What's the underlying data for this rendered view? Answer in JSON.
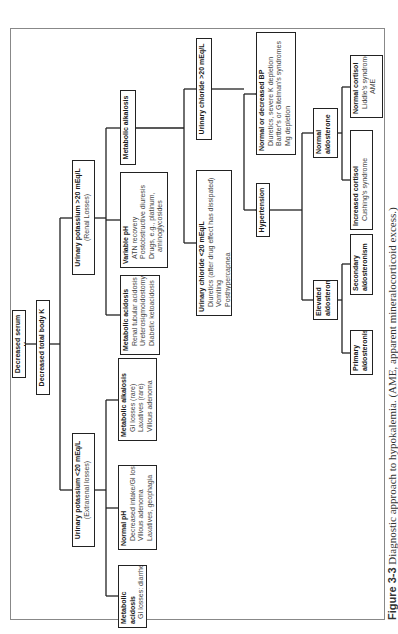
{
  "figure": {
    "caption_label": "Figure 3-3",
    "caption_text": "Diagnostic approach to hypokalemia. (AME, apparent mineralocorticoid excess.)",
    "orientation": "rotated 90 degrees counter-clockwise"
  },
  "nodes": {
    "root": {
      "title": "Decreased serum K"
    },
    "total_body": {
      "title": "Decreased total body K"
    },
    "extrarenal": {
      "title": "Urinary potassium <20 mEq/L",
      "subtitle": "(Extrarenal losses)"
    },
    "renal": {
      "title": "Urinary potassium >20 mEq/L",
      "subtitle": "(Renal Losses)"
    },
    "ext_acidosis": {
      "title": "Metabolic acidosis",
      "lines": [
        "GI losses: diarrhea,",
        "laxatives"
      ]
    },
    "ext_normal_ph": {
      "title": "Normal pH",
      "lines": [
        "Decreased intake/GI losses",
        "Villous adenoma",
        "Laxatives, geophagia"
      ]
    },
    "ext_alkalosis": {
      "title": "Metabolic alkalosis",
      "lines": [
        "GI losses (rare)",
        "Laxatives (rare)",
        "Villous adenoma"
      ]
    },
    "ren_acidosis": {
      "title": "Metabolic acidosis",
      "lines": [
        "Renal tubular acidosis",
        "Ureterosigmoidostomy",
        "Diabetic ketoacidosis"
      ]
    },
    "ren_variable_ph": {
      "title": "Variable pH",
      "lines": [
        "ATN recovery",
        "Postobstructive diuresis",
        "Drugs, e.g., platinum,",
        "aminoglycosides"
      ]
    },
    "ren_alkalosis": {
      "title": "Metabolic alkalosis"
    },
    "cl_low": {
      "title": "Urinary chloride <20 mEq/L",
      "lines": [
        "Diuretics (after drug effect has dissipated)",
        "Vomiting",
        "Posthypercapnea"
      ]
    },
    "cl_high": {
      "title": "Urinary chloride >20 mEq/L"
    },
    "hypertension": {
      "title": "Hypertension"
    },
    "normal_bp": {
      "title": "Normal or decreased BP",
      "lines": [
        "Diuretics, severe K depletion",
        "Bartter's or Gitelman's syndromes",
        "Mg depletion"
      ]
    },
    "elevated_aldo": {
      "title": "Elevated",
      "title2": "aldosterone"
    },
    "normal_aldo": {
      "title": "Normal",
      "title2": "aldosterone"
    },
    "primary_aldo": {
      "title": "Primary",
      "title2": "aldosteronism"
    },
    "secondary_aldo": {
      "title": "Secondary",
      "title2": "aldosteronism"
    },
    "increased_cortisol": {
      "title": "Increased cortisol",
      "lines": [
        "Cushing's syndrome"
      ]
    },
    "normal_cortisol": {
      "title": "Normal cortisol",
      "lines": [
        "Liddle's syndrome",
        "AME"
      ]
    }
  },
  "colors": {
    "line": "#222222",
    "text": "#1a1a1a",
    "frame": "#888888"
  }
}
